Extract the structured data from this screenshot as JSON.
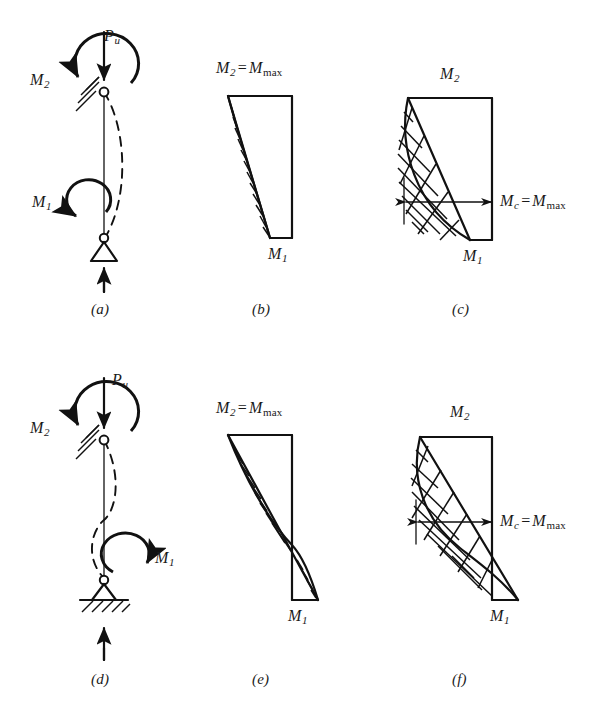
{
  "figure": {
    "background_color": "#ffffff",
    "line_color": "#111111"
  },
  "symbols": {
    "M": "M",
    "P": "P",
    "sub_1": "1",
    "sub_2": "2",
    "sub_u": "u",
    "sub_c": "c",
    "sub_max": "max",
    "equals": "="
  },
  "panels": [
    {
      "id": "a",
      "caption": "(a)",
      "kind": "column-free-body",
      "curvature": "single",
      "labels": {
        "axial_load": "P",
        "axial_load_sub": "u",
        "moment_top": "M",
        "moment_top_sub": "2",
        "moment_bottom": "M",
        "moment_bottom_sub": "1"
      },
      "supports": {
        "top": "pin-against-hatched-wall",
        "bottom": "pin-on-triangle-roller"
      }
    },
    {
      "id": "b",
      "caption": "(b)",
      "kind": "primary-moment-diagram",
      "curvature": "single",
      "labels": {
        "top": "M",
        "top_sub": "2",
        "top_eq": "=",
        "top_right": "M",
        "top_right_sub": "max",
        "bottom": "M",
        "bottom_sub": "1"
      },
      "top_text": "M2 = Mmax",
      "bottom_text": "M1"
    },
    {
      "id": "c",
      "caption": "(c)",
      "kind": "magnified-moment-diagram",
      "curvature": "single",
      "labels": {
        "top": "M",
        "top_sub": "2",
        "bottom": "M",
        "bottom_sub": "1",
        "mid": "M",
        "mid_sub": "c",
        "mid_eq": "=",
        "mid_right": "M",
        "mid_right_sub": "max"
      },
      "mid_text": "Mc = Mmax"
    },
    {
      "id": "d",
      "caption": "(d)",
      "kind": "column-free-body",
      "curvature": "double",
      "labels": {
        "axial_load": "P",
        "axial_load_sub": "u",
        "moment_top": "M",
        "moment_top_sub": "2",
        "moment_bottom": "M",
        "moment_bottom_sub": "1"
      },
      "supports": {
        "top": "pin-against-hatched-wall",
        "bottom": "pin-on-hatched-ground"
      }
    },
    {
      "id": "e",
      "caption": "(e)",
      "kind": "primary-moment-diagram",
      "curvature": "double",
      "labels": {
        "top": "M",
        "top_sub": "2",
        "top_eq": "=",
        "top_right": "M",
        "top_right_sub": "max",
        "bottom": "M",
        "bottom_sub": "1"
      },
      "top_text": "M2 = Mmax",
      "bottom_text": "M1"
    },
    {
      "id": "f",
      "caption": "(f)",
      "kind": "magnified-moment-diagram",
      "curvature": "double",
      "labels": {
        "top": "M",
        "top_sub": "2",
        "bottom": "M",
        "bottom_sub": "1",
        "mid": "M",
        "mid_sub": "c",
        "mid_eq": "=",
        "mid_right": "M",
        "mid_right_sub": "max"
      },
      "mid_text": "Mc = Mmax"
    }
  ],
  "text_items": {
    "a_Pu_M": "P",
    "a_Pu_sub": "u",
    "a_M2_M": "M",
    "a_M2_sub": "2",
    "a_M1_M": "M",
    "a_M1_sub": "1",
    "a_caption": "(a)",
    "b_M2_M": "M",
    "b_M2_sub": "2",
    "b_eq": "=",
    "b_Mmax_M": "M",
    "b_Mmax_sub": "max",
    "b_M1_M": "M",
    "b_M1_sub": "1",
    "b_caption": "(b)",
    "c_M2_M": "M",
    "c_M2_sub": "2",
    "c_M1_M": "M",
    "c_M1_sub": "1",
    "c_Mc_M": "M",
    "c_Mc_sub": "c",
    "c_eq": "=",
    "c_Mmax_M": "M",
    "c_Mmax_sub": "max",
    "c_caption": "(c)",
    "d_Pu_M": "P",
    "d_Pu_sub": "u",
    "d_M2_M": "M",
    "d_M2_sub": "2",
    "d_M1_M": "M",
    "d_M1_sub": "1",
    "d_caption": "(d)",
    "e_M2_M": "M",
    "e_M2_sub": "2",
    "e_eq": "=",
    "e_Mmax_M": "M",
    "e_Mmax_sub": "max",
    "e_M1_M": "M",
    "e_M1_sub": "1",
    "e_caption": "(e)",
    "f_M2_M": "M",
    "f_M2_sub": "2",
    "f_M1_M": "M",
    "f_M1_sub": "1",
    "f_Mc_M": "M",
    "f_Mc_sub": "c",
    "f_eq": "=",
    "f_Mmax_M": "M",
    "f_Mmax_sub": "max",
    "f_caption": "(f)"
  }
}
